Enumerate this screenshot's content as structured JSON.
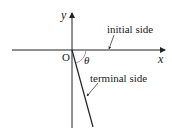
{
  "diagram": {
    "labels": {
      "y_axis": "y",
      "x_axis": "x",
      "origin": "O",
      "angle": "θ",
      "initial_side": "initial side",
      "terminal_side": "terminal side"
    },
    "colors": {
      "line": "#222222",
      "arc": "#888888",
      "background": "#ffffff"
    }
  }
}
